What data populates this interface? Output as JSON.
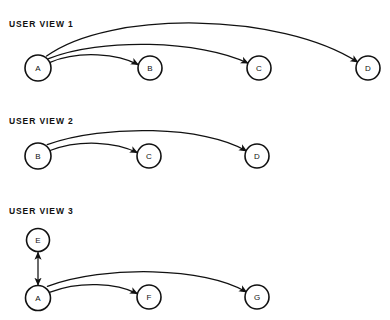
{
  "canvas": {
    "width": 390,
    "height": 320,
    "background_color": "#ffffff",
    "ink_color": "#111111"
  },
  "diagram": {
    "type": "directed-graph-views",
    "sections": [
      {
        "id": "user-view-1",
        "label": "USER VIEW 1",
        "label_x": 9,
        "label_y": 27,
        "nodes": [
          {
            "id": "v1-a",
            "label": "A",
            "cx": 38,
            "cy": 68,
            "r": 13
          },
          {
            "id": "v1-b",
            "label": "B",
            "cx": 150,
            "cy": 68,
            "r": 12
          },
          {
            "id": "v1-c",
            "label": "C",
            "cx": 259,
            "cy": 68,
            "r": 12
          },
          {
            "id": "v1-d",
            "label": "D",
            "cx": 368,
            "cy": 68,
            "r": 12
          }
        ],
        "edges": [
          {
            "id": "v1-a-b",
            "from": "A",
            "to": "B",
            "arrowheads": "end",
            "path": "M 50.1 62.3 C 80 50 118 54 138.2 64.6"
          },
          {
            "id": "v1-a-c",
            "from": "A",
            "to": "C",
            "arrowheads": "end",
            "path": "M 48.6 58.6 C 100 38 200 40 248.0 63.2"
          },
          {
            "id": "v1-a-d",
            "from": "A",
            "to": "D",
            "arrowheads": "end",
            "path": "M 46.6 56.1 C 110 10 280 12 357.8 62.1"
          }
        ]
      },
      {
        "id": "user-view-2",
        "label": "USER VIEW 2",
        "label_x": 9,
        "label_y": 124,
        "nodes": [
          {
            "id": "v2-b",
            "label": "B",
            "cx": 38,
            "cy": 156,
            "r": 13
          },
          {
            "id": "v2-c",
            "label": "C",
            "cx": 149,
            "cy": 156,
            "r": 12
          },
          {
            "id": "v2-d",
            "label": "D",
            "cx": 257,
            "cy": 156,
            "r": 12
          }
        ],
        "edges": [
          {
            "id": "v2-b-c",
            "from": "B",
            "to": "C",
            "arrowheads": "end",
            "path": "M 50.1 150.5 C 80 139 116 142 137.3 152.6"
          },
          {
            "id": "v2-b-d",
            "from": "B",
            "to": "D",
            "arrowheads": "end",
            "path": "M 47.2 144.6 C 105 124 205 126 246.5 151.0"
          }
        ]
      },
      {
        "id": "user-view-3",
        "label": "USER VIEW 3",
        "label_x": 9,
        "label_y": 214,
        "nodes": [
          {
            "id": "v3-e",
            "label": "E",
            "cx": 38,
            "cy": 240,
            "r": 11.5
          },
          {
            "id": "v3-a",
            "label": "A",
            "cx": 38,
            "cy": 298,
            "r": 12.5
          },
          {
            "id": "v3-f",
            "label": "F",
            "cx": 149,
            "cy": 297,
            "r": 12
          },
          {
            "id": "v3-g",
            "label": "G",
            "cx": 257,
            "cy": 297,
            "r": 12
          }
        ],
        "edges": [
          {
            "id": "v3-e-a",
            "from": "E",
            "to": "A",
            "arrowheads": "both",
            "path": "M 38 252.5 L 38 285"
          },
          {
            "id": "v3-a-f",
            "from": "A",
            "to": "F",
            "arrowheads": "end",
            "path": "M 50.2 292.1 C 80 281 116 283 137.3 293.6"
          },
          {
            "id": "v3-a-g",
            "from": "A",
            "to": "G",
            "arrowheads": "end",
            "path": "M 47.4 286.4 C 105 265 205 267 246.5 292.0"
          }
        ]
      }
    ]
  }
}
